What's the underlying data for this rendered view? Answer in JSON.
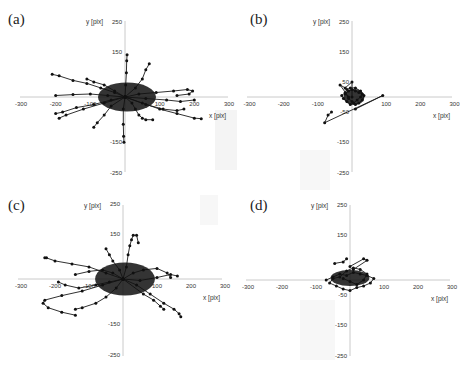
{
  "figure": {
    "panels": [
      {
        "id": "a",
        "label": "(a)"
      },
      {
        "id": "b",
        "label": "(b)"
      },
      {
        "id": "c",
        "label": "(c)"
      },
      {
        "id": "d",
        "label": "(d)"
      }
    ]
  },
  "chart_data": [
    {
      "type": "scatter",
      "title": "(a)",
      "xlabel": "x [pix]",
      "ylabel": "y [pix]",
      "xlim": [
        -300,
        300
      ],
      "ylim": [
        -250,
        250
      ],
      "x_ticks": [
        -300,
        -200,
        -100,
        100,
        200,
        300
      ],
      "y_ticks": [
        250,
        150,
        50,
        -50,
        -150,
        -250
      ],
      "x_tick_labels": [
        "-300",
        "-200",
        "-100",
        "100",
        "200",
        "300"
      ],
      "y_tick_labels": [
        "250",
        "150",
        "-150",
        "-250"
      ],
      "grid": false,
      "description": "Many connected-marker trajectories radiating from origin; spread roughly x -210..220, y -150..140",
      "series": [
        {
          "name": "t1",
          "x": [
            0,
            -30,
            -70,
            -110,
            -150,
            -190,
            -210
          ],
          "y": [
            0,
            15,
            30,
            45,
            55,
            70,
            75
          ]
        },
        {
          "name": "t2",
          "x": [
            0,
            40,
            90,
            140,
            180,
            195,
            185,
            150
          ],
          "y": [
            0,
            10,
            15,
            20,
            25,
            20,
            10,
            5
          ]
        },
        {
          "name": "t3",
          "x": [
            0,
            50,
            100,
            150,
            200,
            220
          ],
          "y": [
            0,
            -20,
            -40,
            -55,
            -70,
            -72
          ]
        },
        {
          "name": "t4",
          "x": [
            0,
            -40,
            -90,
            -140,
            -180,
            -200
          ],
          "y": [
            0,
            -10,
            -25,
            -35,
            -50,
            -55
          ]
        },
        {
          "name": "t5",
          "x": [
            0,
            2,
            4,
            5,
            6
          ],
          "y": [
            0,
            40,
            80,
            120,
            140
          ]
        },
        {
          "name": "t6",
          "x": [
            0,
            -5,
            -5,
            -4,
            -3
          ],
          "y": [
            0,
            -40,
            -90,
            -130,
            -150
          ]
        },
        {
          "name": "t7",
          "x": [
            0,
            60,
            120,
            160,
            200
          ],
          "y": [
            0,
            -5,
            -10,
            -15,
            -10
          ]
        },
        {
          "name": "t8",
          "x": [
            0,
            -50,
            -100,
            -150,
            -200
          ],
          "y": [
            0,
            5,
            10,
            8,
            5
          ]
        },
        {
          "name": "t9",
          "x": [
            0,
            20,
            30,
            40,
            50,
            60,
            80
          ],
          "y": [
            0,
            -20,
            -40,
            -60,
            -70,
            -75,
            -75
          ]
        },
        {
          "name": "t10",
          "x": [
            0,
            -40,
            -60,
            -80,
            -90
          ],
          "y": [
            0,
            -30,
            -60,
            -85,
            -100
          ]
        },
        {
          "name": "t11",
          "x": [
            0,
            30,
            50,
            60,
            70
          ],
          "y": [
            0,
            30,
            60,
            90,
            110
          ]
        },
        {
          "name": "t12",
          "x": [
            0,
            -30,
            -60,
            -90,
            -110
          ],
          "y": [
            0,
            20,
            40,
            50,
            60
          ]
        },
        {
          "name": "t13",
          "x": [
            0,
            60,
            110,
            150,
            170
          ],
          "y": [
            0,
            -25,
            -40,
            -45,
            -40
          ]
        },
        {
          "name": "t14",
          "x": [
            0,
            -60,
            -120,
            -170,
            -190
          ],
          "y": [
            0,
            -20,
            -40,
            -60,
            -70
          ]
        }
      ]
    },
    {
      "type": "scatter",
      "title": "(b)",
      "xlabel": "x [pix]",
      "ylabel": "y [pix]",
      "xlim": [
        -300,
        300
      ],
      "ylim": [
        -250,
        250
      ],
      "x_ticks": [
        -300,
        -200,
        -100,
        100,
        200,
        300
      ],
      "y_ticks": [
        250,
        150,
        50,
        -50,
        -150,
        -250
      ],
      "x_tick_labels": [
        "-300",
        "-200",
        "-100",
        "100",
        "200",
        "300"
      ],
      "y_tick_labels": [
        "250",
        "150",
        "50",
        "-50",
        "-150",
        "-250"
      ],
      "grid": false,
      "description": "Dense cluster near origin (x -30..40, y -40..40) with outlier path to (90,5) and (-80,-85)",
      "series": [
        {
          "name": "cluster",
          "x": [
            -20,
            -10,
            0,
            10,
            20,
            30,
            25,
            15,
            5,
            -5,
            -15,
            -25,
            -30,
            -20,
            -10,
            0,
            10,
            20,
            30,
            35,
            25,
            10,
            -5,
            -15
          ],
          "y": [
            10,
            20,
            25,
            20,
            15,
            10,
            0,
            -10,
            -20,
            -25,
            -15,
            -5,
            5,
            15,
            -5,
            -15,
            -25,
            -20,
            -10,
            5,
            20,
            30,
            30,
            25
          ]
        },
        {
          "name": "spikes",
          "x": [
            -10,
            -35,
            -20,
            0,
            0
          ],
          "y": [
            0,
            40,
            30,
            50,
            0
          ]
        },
        {
          "name": "outlier",
          "x": [
            10,
            90,
            -80,
            -70,
            -60
          ],
          "y": [
            -40,
            5,
            -85,
            -60,
            -50
          ]
        }
      ]
    },
    {
      "type": "scatter",
      "title": "(c)",
      "xlabel": "x [pix]",
      "ylabel": "y [pix]",
      "xlim": [
        -300,
        300
      ],
      "ylim": [
        -250,
        250
      ],
      "x_ticks": [
        -300,
        -200,
        -100,
        100,
        200,
        300
      ],
      "y_ticks": [
        250,
        150,
        -150,
        -250
      ],
      "x_tick_labels": [
        "-300",
        "-200",
        "-100",
        "100",
        "200",
        "300"
      ],
      "y_tick_labels": [
        "250",
        "150",
        "-150",
        "-250"
      ],
      "grid": false,
      "description": "Wide tangled trajectories spanning x -240..170, y -130..150; heavy cluster at origin",
      "series": [
        {
          "name": "t1",
          "x": [
            0,
            -50,
            -100,
            -150,
            -200,
            -225,
            -230
          ],
          "y": [
            0,
            20,
            40,
            50,
            60,
            70,
            70
          ]
        },
        {
          "name": "t2",
          "x": [
            0,
            -60,
            -120,
            -180,
            -230,
            -235,
            -220,
            -180,
            -140
          ],
          "y": [
            0,
            -20,
            -40,
            -55,
            -70,
            -80,
            -95,
            -110,
            -120
          ]
        },
        {
          "name": "t3",
          "x": [
            0,
            40,
            80,
            120,
            150,
            165,
            170
          ],
          "y": [
            0,
            -20,
            -50,
            -80,
            -100,
            -115,
            -125
          ]
        },
        {
          "name": "t4",
          "x": [
            0,
            30,
            60,
            100,
            130,
            140
          ],
          "y": [
            0,
            20,
            30,
            35,
            20,
            5
          ]
        },
        {
          "name": "t5",
          "x": [
            0,
            10,
            15,
            20,
            25,
            30,
            40,
            45
          ],
          "y": [
            0,
            40,
            80,
            110,
            130,
            145,
            145,
            120
          ]
        },
        {
          "name": "t6",
          "x": [
            0,
            -40,
            -80,
            -130,
            -170,
            -190
          ],
          "y": [
            0,
            -10,
            -20,
            -30,
            -20,
            -10
          ]
        },
        {
          "name": "t7",
          "x": [
            0,
            -30,
            -60,
            -100,
            -140
          ],
          "y": [
            0,
            20,
            30,
            25,
            15
          ]
        },
        {
          "name": "t8",
          "x": [
            0,
            -20,
            -50,
            -80,
            -120,
            -140
          ],
          "y": [
            0,
            -30,
            -60,
            -80,
            -95,
            -100
          ]
        },
        {
          "name": "t9",
          "x": [
            0,
            50,
            100,
            140,
            160
          ],
          "y": [
            0,
            -5,
            5,
            15,
            10
          ]
        },
        {
          "name": "t10",
          "x": [
            0,
            -10,
            -30,
            -40,
            -50
          ],
          "y": [
            0,
            30,
            60,
            80,
            100
          ]
        },
        {
          "name": "t11",
          "x": [
            0,
            60,
            90,
            110,
            120
          ],
          "y": [
            0,
            -50,
            -70,
            -90,
            -100
          ]
        }
      ]
    },
    {
      "type": "scatter",
      "title": "(d)",
      "xlabel": "x [pix]",
      "ylabel": "y [pix]",
      "xlim": [
        -300,
        300
      ],
      "ylim": [
        -250,
        250
      ],
      "x_ticks": [
        -300,
        -200,
        -100,
        100,
        200,
        300
      ],
      "y_ticks": [
        250,
        150,
        -50,
        -150,
        -250
      ],
      "x_tick_labels": [
        "-300",
        "-200",
        "-100",
        "100",
        "200",
        "300"
      ],
      "y_tick_labels": [
        "250",
        "150",
        "-50",
        "-150",
        "-250"
      ],
      "grid": false,
      "description": "Compact cluster x -80..80, y -40..70 with a few diagonal segments up-right",
      "series": [
        {
          "name": "cluster",
          "x": [
            -70,
            -50,
            -30,
            -10,
            10,
            30,
            50,
            70,
            60,
            40,
            20,
            0,
            -20,
            -40,
            -60,
            -50,
            -30,
            -10,
            10,
            30,
            50,
            40,
            20,
            0,
            -20
          ],
          "y": [
            0,
            10,
            20,
            15,
            25,
            20,
            15,
            5,
            -10,
            -20,
            -25,
            -35,
            -30,
            -20,
            -10,
            5,
            10,
            30,
            40,
            35,
            20,
            0,
            -15,
            -5,
            5
          ]
        },
        {
          "name": "seg1",
          "x": [
            -45,
            -20,
            -10
          ],
          "y": [
            55,
            60,
            70
          ]
        },
        {
          "name": "seg2",
          "x": [
            0,
            40,
            50,
            10
          ],
          "y": [
            45,
            70,
            65,
            35
          ]
        }
      ]
    }
  ]
}
